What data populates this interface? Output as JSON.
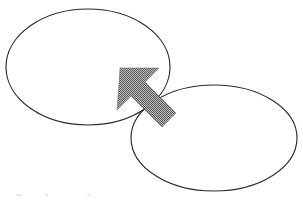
{
  "page": {
    "width": 303,
    "height": 203,
    "background_color": "#ffffff"
  },
  "diagram": {
    "kind": "venn-like-overlapping-ellipses-with-pointer-arrow",
    "stroke_color": "#2b2b2b",
    "fill_color": "#ffffff",
    "arrow_fill_color": "#8a8a8a",
    "arrow_pattern": "checkerboard-dither-50-percent",
    "shapes": [
      {
        "name": "upper-left-ellipse",
        "type": "ellipse",
        "cx": 88,
        "cy": 67,
        "rx": 82,
        "ry": 58,
        "label": ""
      },
      {
        "name": "lower-right-ellipse",
        "type": "ellipse",
        "cx": 214,
        "cy": 138,
        "rx": 83,
        "ry": 53,
        "label": ""
      },
      {
        "name": "pointer-arrow",
        "type": "block-arrow",
        "direction": "up-left",
        "tip_x": 120,
        "tip_y": 68,
        "tail_x": 176,
        "tail_y": 126,
        "label": ""
      }
    ]
  },
  "footer": {
    "clipped_caption": "Figure  partially  cut  off"
  }
}
